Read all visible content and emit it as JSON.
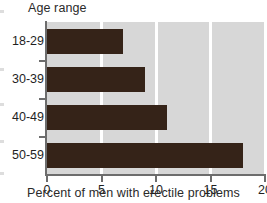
{
  "chart_data": {
    "type": "bar",
    "orientation": "horizontal",
    "title": "Age range",
    "subtitle": "",
    "xlabel": "Percent of men with erectile problems",
    "ylabel": "Age range",
    "categories": [
      "18-29",
      "30-39",
      "40-49",
      "50-59"
    ],
    "values": [
      7,
      9,
      11,
      18
    ],
    "xlim": [
      0,
      20
    ],
    "xticks": [
      0,
      5,
      10,
      15,
      20
    ],
    "xtick_labels": [
      "0",
      "5",
      "10",
      "15",
      "20"
    ],
    "grid": "vertical-white",
    "legend": "none",
    "bar_color": "#352318",
    "plot_background": "#d7d7d7",
    "figure_background": "#ffffff",
    "axis_color": "#6d6d6d",
    "gridline_color": "#ffffff"
  }
}
